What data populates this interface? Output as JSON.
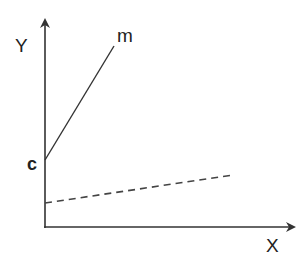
{
  "diagram": {
    "type": "line-graph-sketch",
    "axes": {
      "y_label": "Y",
      "x_label": "X"
    },
    "lines": [
      {
        "name": "solid-line",
        "style": "solid",
        "end_label": "m",
        "intercept_label": "c"
      },
      {
        "name": "dashed-line",
        "style": "dashed"
      }
    ],
    "colors": {
      "stroke": "#333333",
      "background": "#ffffff"
    }
  }
}
